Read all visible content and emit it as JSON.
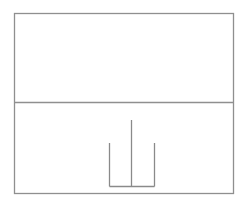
{
  "diagram": {
    "canvas": {
      "width": 246,
      "height": 208,
      "background": "#ffffff"
    },
    "colors": {
      "frame": "#8f8f8f",
      "divider": "#8f8f8f",
      "figure": "#8a8a8a"
    },
    "stroke_width": 1.3,
    "frame": {
      "x1": 14.5,
      "y1": 13.5,
      "x2": 233.5,
      "y2": 193.5
    },
    "divider": {
      "y": 102.5
    },
    "panels": [
      {
        "id": "upper-panel",
        "label": "",
        "content": "empty"
      },
      {
        "id": "lower-panel",
        "label": "",
        "content": "trident-figure"
      }
    ],
    "trident": {
      "base_y": 186.5,
      "strokes": [
        {
          "name": "left-prong",
          "x": 109.5,
          "top": 143
        },
        {
          "name": "center-prong",
          "x": 131.5,
          "top": 120
        },
        {
          "name": "right-prong",
          "x": 154.5,
          "top": 143
        }
      ]
    }
  }
}
